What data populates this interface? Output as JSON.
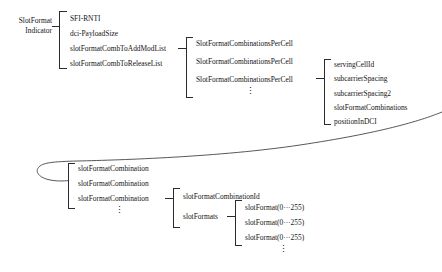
{
  "diagram": {
    "type": "tree-bracket-diagram",
    "root": {
      "line1": "SlotFormat",
      "line2": "Indicator"
    },
    "level1": {
      "items": [
        "SFI-RNTI",
        "dci-PayloadSize",
        "slotFormatCombToAddModList",
        "slotFormatCombToReleaseList"
      ]
    },
    "level2": {
      "items": [
        "SlotFormatCombinationsPerCell",
        "SlotFormatCombinationsPerCell",
        "SlotFormatCombinationsPerCell"
      ],
      "ellipsis": "⋮"
    },
    "level3": {
      "items": [
        "servingCellId",
        "subcarrierSpacing",
        "subcarrierSpacing2",
        "slotFormatCombinations",
        "positionInDCI"
      ]
    },
    "level4": {
      "items": [
        "slotFormatCombination",
        "slotFormatCombination",
        "slotFormatCombination"
      ],
      "ellipsis": "⋮"
    },
    "level5": {
      "items": [
        "slotFormatCombinationId",
        "slotFormats"
      ]
    },
    "level6": {
      "items": [
        "slotFormat(0···255)",
        "slotFormat(0···255)",
        "slotFormat(0···255)"
      ],
      "ellipsis": "⋮"
    }
  }
}
